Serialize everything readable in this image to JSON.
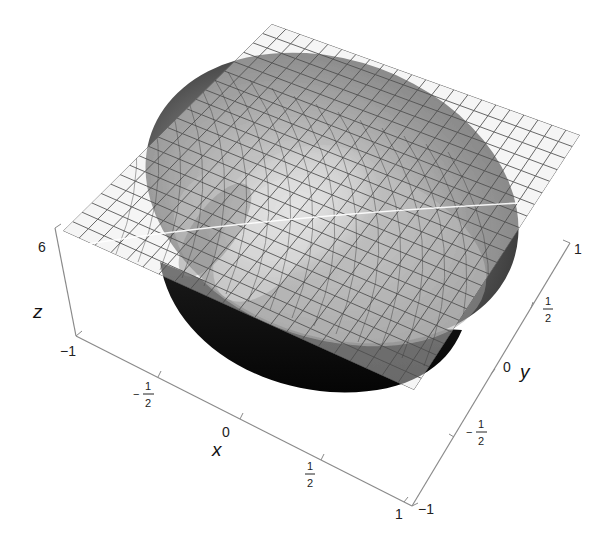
{
  "chart_data": {
    "type": "surface3d",
    "title": "",
    "xlabel": "x",
    "ylabel": "y",
    "zlabel": "z",
    "x_ticks": [
      "-1",
      "-1/2",
      "0",
      "1/2",
      "1"
    ],
    "y_ticks": [
      "-1",
      "-1/2",
      "0",
      "1/2",
      "1"
    ],
    "z_ticks": [
      "6"
    ],
    "xlim": [
      -1,
      1
    ],
    "ylim": [
      -1,
      1
    ],
    "colors": {
      "surface_dark": "#0a0a0a",
      "surface_mid": "#5a5a5a",
      "surface_light": "#c8c8c8",
      "plane_fill": "#e9e9e9",
      "grid_line": "#555555",
      "axis_line": "#888888"
    }
  },
  "labels": {
    "z_axis": "z",
    "x_axis": "x",
    "y_axis": "y",
    "z_tick_top": "6",
    "x_tick_neg1": "−1",
    "x_tick_0": "0",
    "x_tick_1": "1",
    "y_tick_neg1": "−1",
    "y_tick_0": "0",
    "y_tick_1": "1",
    "frac_num": "1",
    "frac_den": "2",
    "minus": "−"
  }
}
